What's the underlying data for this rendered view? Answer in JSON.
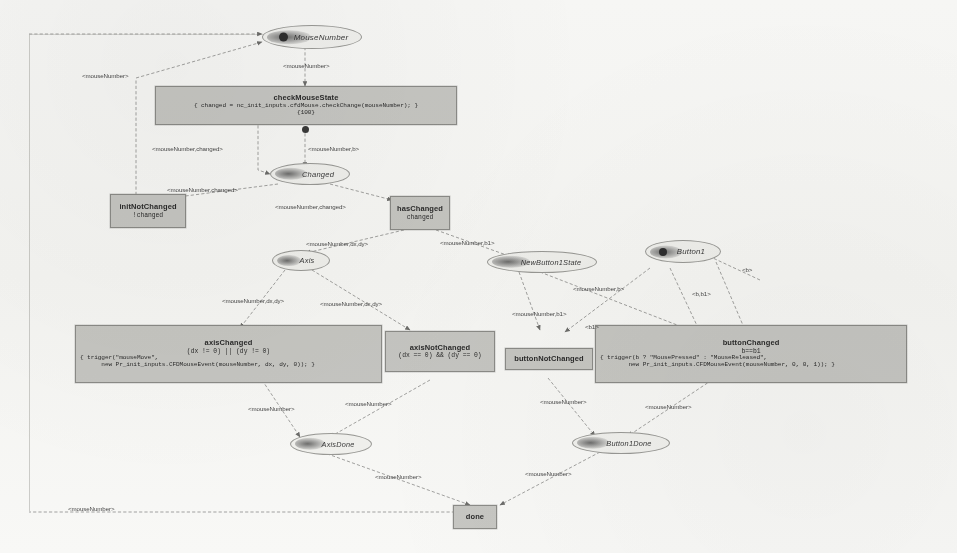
{
  "diagram": {
    "kind": "state-transition-graph",
    "title_visible": false,
    "background_color": "#fbfbfa",
    "node_fill": "#c9c9c6",
    "node_stroke": "#8d8d8a",
    "edge_color": "#8a8a88",
    "text_color": "#2b2b2b"
  },
  "nodes": {
    "mouse_number": {
      "label": "MouseNumber",
      "shape": "ellipse"
    },
    "check_mouse_state": {
      "title": "checkMouseState",
      "code_line_1": "{ changed = nc_init_inputs.cfdMouse.checkChange(mouseNumber); }",
      "code_line_2": "{100}",
      "shape": "box"
    },
    "changed": {
      "label": "Changed",
      "shape": "ellipse"
    },
    "init_not_changed": {
      "title": "initNotChanged",
      "cond": "!changed",
      "shape": "box"
    },
    "has_changed": {
      "title": "hasChanged",
      "cond": "changed",
      "shape": "box"
    },
    "axis": {
      "label": "Axis",
      "shape": "ellipse"
    },
    "new_button1_state": {
      "label": "NewButton1State",
      "shape": "ellipse"
    },
    "button1": {
      "label": "Button1",
      "shape": "ellipse"
    },
    "axis_changed": {
      "title": "axisChanged",
      "cond": "(dx != 0) || (dy != 0)",
      "code_line_1": "{ trigger(\"mouseMove\",",
      "code_line_2": "      new Pr_init_inputs.CFDMouseEvent(mouseNumber, dx, dy, 0)); }",
      "shape": "box"
    },
    "axis_not_changed": {
      "title": "axisNotChanged",
      "cond": "(dx == 0) && (dy == 0)",
      "shape": "box"
    },
    "button_not_changed": {
      "title": "buttonNotChanged",
      "shape": "box"
    },
    "button_changed": {
      "title": "buttonChanged",
      "cond": "b==b1",
      "code_line_1": "{ trigger(b ? \"MousePressed\" : \"MouseReleased\",",
      "code_line_2": "        new Pr_init_inputs.CFDMouseEvent(mouseNumber, 0, 0, 1)); }",
      "shape": "box"
    },
    "axis_done": {
      "label": "AxisDone",
      "shape": "ellipse"
    },
    "button1_done": {
      "label": "Button1Done",
      "shape": "ellipse"
    },
    "done": {
      "label": "done",
      "shape": "box"
    }
  },
  "edge_labels": {
    "mouse_number_plain": "<mouseNumber>",
    "mouse_number_feedback_top": "<mouseNumber>",
    "mouse_number_changed": "<mouseNumber,changed>",
    "mouse_number_b": "<mouseNumber,b>",
    "mouse_number_changed_2": "<mouseNumber,changed>",
    "mouse_number_changed_3": "<mouseNumber,changed>",
    "mouse_number_dx_dy": "<mouseNumber,dx,dy>",
    "mouse_number_b1": "<mouseNumber,b1>",
    "mouse_number_dx_dy_2": "<mouseNumber,dx,dy>",
    "mouse_number_dx_dy_3": "<mouseNumber,dx,dy>",
    "mouse_number_b_2": "<mouseNumber,b>",
    "mouse_number_b1_2": "<mouseNumber,b1>",
    "b_1": "<b1>",
    "b_b1": "<b,b1>",
    "b_only": "<b>",
    "mouse_number_out_1": "<mouseNumber>",
    "mouse_number_out_2": "<mouseNumber>",
    "mouse_number_out_3": "<mouseNumber>",
    "mouse_number_out_4": "<mouseNumber>",
    "mouse_number_done_left": "<mouseNumber>",
    "mouse_number_done_right": "<mouseNumber>",
    "mouse_number_loopback": "<mouseNumber>"
  }
}
